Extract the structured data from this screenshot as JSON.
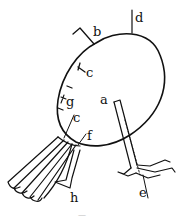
{
  "figure": {
    "type": "anatomical line drawing",
    "stroke_color": "#111111",
    "background": "#ffffff",
    "labels": [
      {
        "id": "a",
        "text": "a",
        "x": 101,
        "y": 103
      },
      {
        "id": "b",
        "text": "b",
        "x": 93,
        "y": 36
      },
      {
        "id": "c1",
        "text": "c",
        "x": 86,
        "y": 76
      },
      {
        "id": "c2",
        "text": "c",
        "x": 72,
        "y": 122
      },
      {
        "id": "d",
        "text": "d",
        "x": 140,
        "y": 197
      },
      {
        "id": "e",
        "text": "e",
        "x": 135,
        "y": 22
      },
      {
        "id": "f",
        "text": "f",
        "x": 87,
        "y": 140
      },
      {
        "id": "g",
        "text": "g",
        "x": 66,
        "y": 106
      },
      {
        "id": "h",
        "text": "h",
        "x": 70,
        "y": 202
      }
    ],
    "caption": "—"
  }
}
